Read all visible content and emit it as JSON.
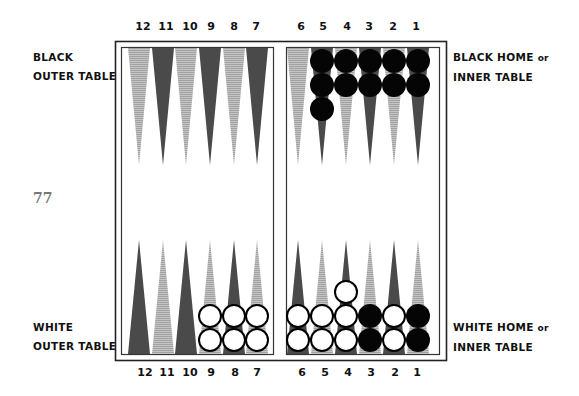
{
  "page": {
    "page_number": "77"
  },
  "labels": {
    "black_outer_line1": "BLACK",
    "black_outer_line2": "OUTER TABLE",
    "black_home_line1": "BLACK HOME",
    "black_home_or": "or",
    "black_home_line2": "INNER TABLE",
    "white_outer_line1": "WHITE",
    "white_outer_line2": "OUTER TABLE",
    "white_home_line1": "WHITE HOME",
    "white_home_or": "or",
    "white_home_line2": "INNER TABLE"
  },
  "top_numbers": [
    "12",
    "11",
    "10",
    "9",
    "8",
    "7",
    "6",
    "5",
    "4",
    "3",
    "2",
    "1"
  ],
  "bottom_numbers": [
    "12",
    "11",
    "10",
    "9",
    "8",
    "7",
    "6",
    "5",
    "4",
    "3",
    "2",
    "1"
  ],
  "colors": {
    "dark_point": "#4a4a4a",
    "light_point": "#b4b4b4",
    "black_checker": "#050505",
    "white_checker": "#ffffff",
    "frame": "#222222"
  },
  "board": {
    "top_points": [
      {
        "point": "12",
        "shade": "light",
        "checkers": []
      },
      {
        "point": "11",
        "shade": "dark",
        "checkers": []
      },
      {
        "point": "10",
        "shade": "light",
        "checkers": []
      },
      {
        "point": "9",
        "shade": "dark",
        "checkers": []
      },
      {
        "point": "8",
        "shade": "light",
        "checkers": []
      },
      {
        "point": "7",
        "shade": "dark",
        "checkers": []
      },
      {
        "point": "6",
        "shade": "light",
        "checkers": []
      },
      {
        "point": "5",
        "shade": "dark",
        "checkers": [
          "black",
          "black",
          "black"
        ]
      },
      {
        "point": "4",
        "shade": "light",
        "checkers": [
          "black",
          "black"
        ]
      },
      {
        "point": "3",
        "shade": "dark",
        "checkers": [
          "black",
          "black"
        ]
      },
      {
        "point": "2",
        "shade": "light",
        "checkers": [
          "black",
          "black"
        ]
      },
      {
        "point": "1",
        "shade": "dark",
        "checkers": [
          "black",
          "black"
        ]
      }
    ],
    "bottom_points": [
      {
        "point": "12",
        "shade": "dark",
        "checkers": []
      },
      {
        "point": "11",
        "shade": "light",
        "checkers": []
      },
      {
        "point": "10",
        "shade": "dark",
        "checkers": []
      },
      {
        "point": "9",
        "shade": "light",
        "checkers": [
          "white",
          "white"
        ]
      },
      {
        "point": "8",
        "shade": "dark",
        "checkers": [
          "white",
          "white"
        ]
      },
      {
        "point": "7",
        "shade": "light",
        "checkers": [
          "white",
          "white"
        ]
      },
      {
        "point": "6",
        "shade": "dark",
        "checkers": [
          "white",
          "white"
        ]
      },
      {
        "point": "5",
        "shade": "light",
        "checkers": [
          "white",
          "white"
        ]
      },
      {
        "point": "4",
        "shade": "dark",
        "checkers": [
          "white",
          "white",
          "white"
        ]
      },
      {
        "point": "3",
        "shade": "light",
        "checkers": [
          "black",
          "black"
        ]
      },
      {
        "point": "2",
        "shade": "dark",
        "checkers": [
          "white",
          "white"
        ]
      },
      {
        "point": "1",
        "shade": "light",
        "checkers": [
          "black",
          "black"
        ]
      }
    ]
  }
}
